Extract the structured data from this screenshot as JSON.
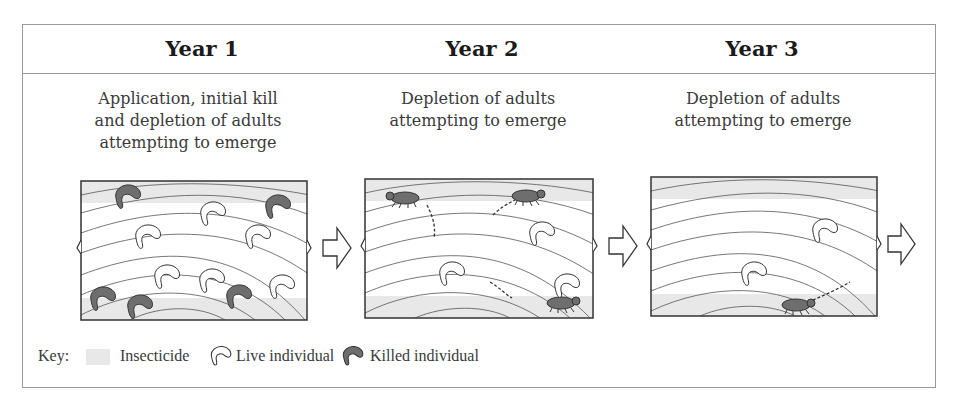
{
  "figure": {
    "columns": [
      {
        "title": "Year 1",
        "caption_lines": [
          "Application, initial kill",
          "and depletion of adults",
          "attempting to emerge"
        ],
        "live_individuals": 8,
        "killed_individuals": 6,
        "emerging_adults": 0
      },
      {
        "title": "Year 2",
        "caption_lines": [
          "Depletion of adults",
          "attempting to emerge"
        ],
        "live_individuals": 3,
        "killed_individuals": 0,
        "emerging_adults": 3
      },
      {
        "title": "Year 3",
        "caption_lines": [
          "Depletion of adults",
          "attempting to emerge"
        ],
        "live_individuals": 2,
        "killed_individuals": 0,
        "emerging_adults": 1
      }
    ],
    "key": {
      "label": "Key:",
      "items": [
        {
          "icon": "insecticide-swatch",
          "label": "Insecticide",
          "color": "#e8e8e8"
        },
        {
          "icon": "live-larva-icon",
          "label": "Live individual",
          "color": "#ffffff"
        },
        {
          "icon": "killed-larva-icon",
          "label": "Killed individual",
          "color": "#6e6e6e"
        }
      ]
    },
    "colors": {
      "border": "#9a9a9a",
      "insecticide": "#e8e8e8",
      "killed_fill": "#6e6e6e",
      "wood_rings": "#555555"
    }
  }
}
